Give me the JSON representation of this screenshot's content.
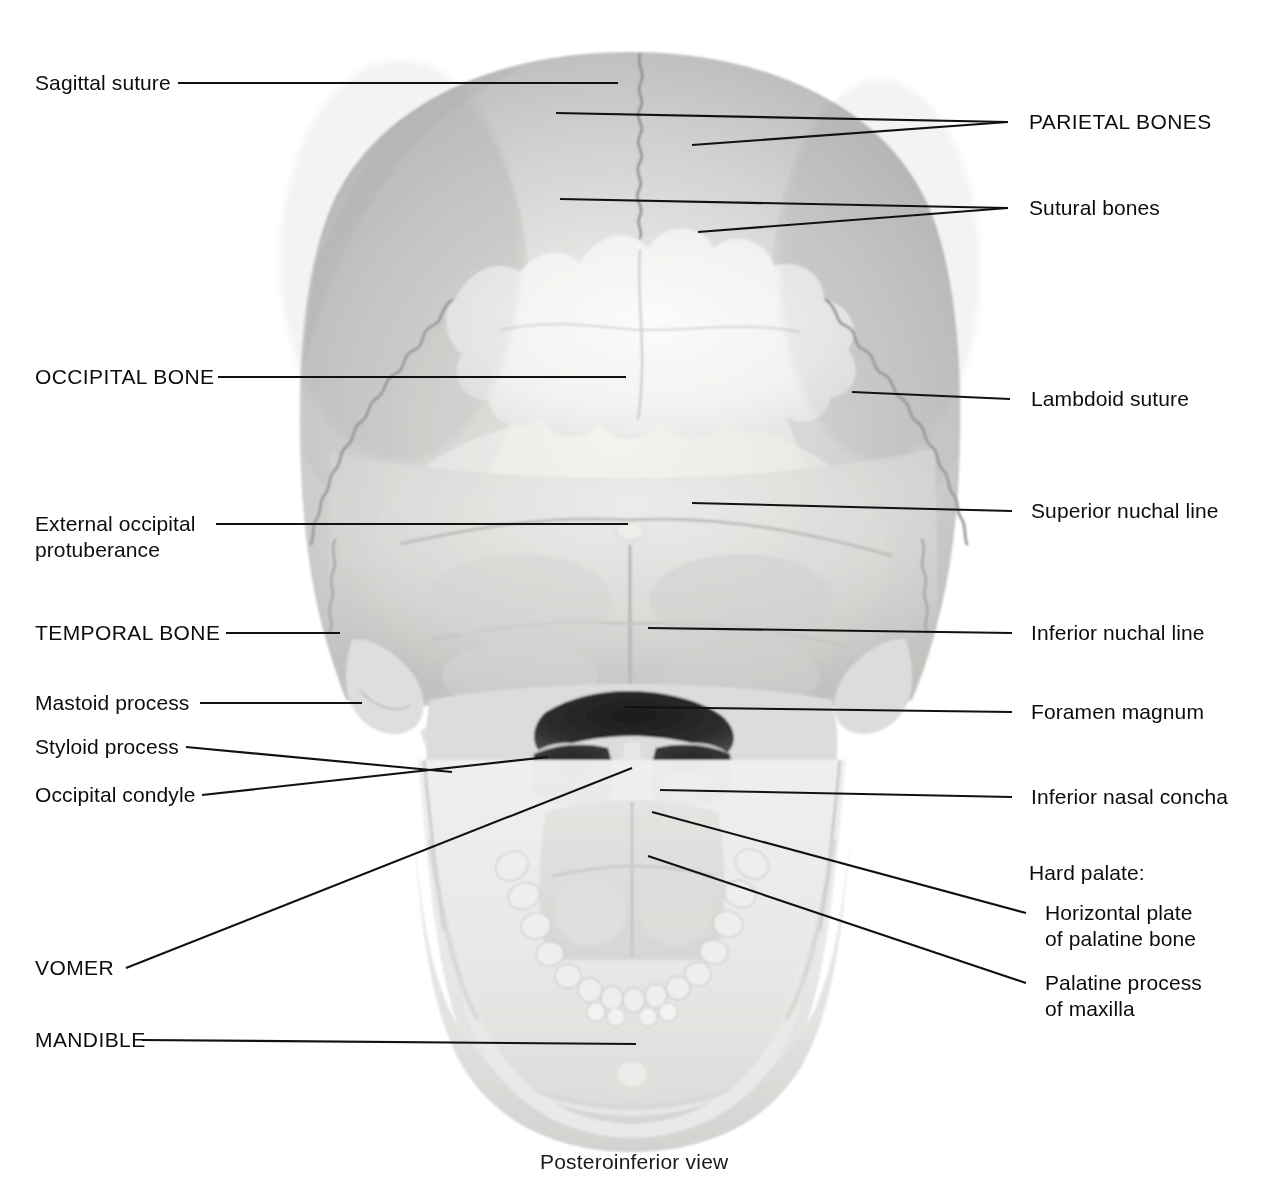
{
  "figure": {
    "caption": "Posteroinferior view",
    "background": "#ffffff",
    "line_color": "#111111",
    "text_color": "#0d0d0d"
  },
  "labels_left": [
    {
      "id": "sagittal-suture",
      "text": "Sagittal suture",
      "emphasis": "normal"
    },
    {
      "id": "occipital-bone",
      "text": "OCCIPITAL BONE",
      "emphasis": "caps"
    },
    {
      "id": "external-occipital-line1",
      "text": "External occipital",
      "emphasis": "normal"
    },
    {
      "id": "external-occipital-line2",
      "text": "protuberance",
      "emphasis": "normal"
    },
    {
      "id": "temporal-bone",
      "text": "TEMPORAL BONE",
      "emphasis": "caps"
    },
    {
      "id": "mastoid-process",
      "text": "Mastoid process",
      "emphasis": "normal"
    },
    {
      "id": "styloid-process",
      "text": "Styloid process",
      "emphasis": "normal"
    },
    {
      "id": "occipital-condyle",
      "text": "Occipital condyle",
      "emphasis": "normal"
    },
    {
      "id": "vomer",
      "text": "VOMER",
      "emphasis": "caps"
    },
    {
      "id": "mandible",
      "text": "MANDIBLE",
      "emphasis": "caps"
    }
  ],
  "labels_right": [
    {
      "id": "parietal-bones",
      "text": "PARIETAL BONES",
      "emphasis": "caps"
    },
    {
      "id": "sutural-bones",
      "text": "Sutural bones",
      "emphasis": "normal"
    },
    {
      "id": "lambdoid-suture",
      "text": "Lambdoid suture",
      "emphasis": "normal"
    },
    {
      "id": "superior-nuchal-line",
      "text": "Superior nuchal line",
      "emphasis": "normal"
    },
    {
      "id": "inferior-nuchal-line",
      "text": "Inferior nuchal line",
      "emphasis": "normal"
    },
    {
      "id": "foramen-magnum",
      "text": "Foramen magnum",
      "emphasis": "normal"
    },
    {
      "id": "inferior-nasal-concha",
      "text": "Inferior nasal concha",
      "emphasis": "normal"
    },
    {
      "id": "hard-palate-heading",
      "text": "Hard palate:",
      "emphasis": "normal"
    },
    {
      "id": "horizontal-plate-line1",
      "text": "Horizontal plate",
      "emphasis": "normal"
    },
    {
      "id": "horizontal-plate-line2",
      "text": "of palatine bone",
      "emphasis": "normal"
    },
    {
      "id": "palatine-process-line1",
      "text": "Palatine process",
      "emphasis": "normal"
    },
    {
      "id": "palatine-process-line2",
      "text": "of maxilla",
      "emphasis": "normal"
    }
  ]
}
